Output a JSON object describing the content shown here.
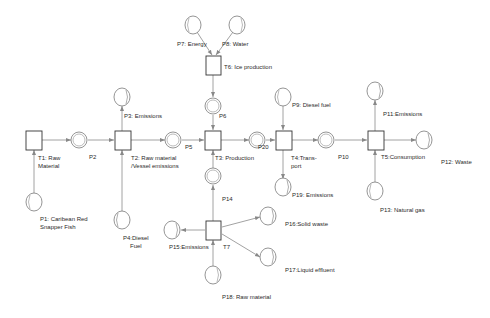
{
  "diagram": {
    "type": "petri-net",
    "style": {
      "line_color": "#8a8a8a",
      "box_color": "#333333",
      "place_color": "#777777",
      "background": "#ffffff"
    },
    "transitions": [
      {
        "id": "T1",
        "label": "T1: Raw\nMaterial"
      },
      {
        "id": "T2",
        "label": "T2: Raw material\n/Vessel emissions"
      },
      {
        "id": "T3",
        "label": "T3: Production"
      },
      {
        "id": "T4",
        "label": "T4:Trans-\nport"
      },
      {
        "id": "T5",
        "label": "T5:Consumption"
      },
      {
        "id": "T6",
        "label": "T6: Ice production"
      },
      {
        "id": "T7",
        "label": "T7"
      }
    ],
    "places": [
      {
        "id": "P1",
        "label": "P1: Caribean Red\nSnapper Fish"
      },
      {
        "id": "P2",
        "label": "P2"
      },
      {
        "id": "P3",
        "label": "P3: Emissions"
      },
      {
        "id": "P4",
        "label": "P4:Diesel\nFuel"
      },
      {
        "id": "P5",
        "label": "P5"
      },
      {
        "id": "P6",
        "label": "P6"
      },
      {
        "id": "P7",
        "label": "P7: Energy"
      },
      {
        "id": "P8",
        "label": "P8: Water"
      },
      {
        "id": "P9",
        "label": "P9: Diesel fuel"
      },
      {
        "id": "P10",
        "label": "P10"
      },
      {
        "id": "P11",
        "label": "P11:Emissions"
      },
      {
        "id": "P12",
        "label": "P12: Waste"
      },
      {
        "id": "P13",
        "label": "P13: Natural gas"
      },
      {
        "id": "P14",
        "label": "P14"
      },
      {
        "id": "P15",
        "label": "P15:Emissions"
      },
      {
        "id": "P16",
        "label": "P16:Solid waste"
      },
      {
        "id": "P17",
        "label": "P17:Liquid effluent"
      },
      {
        "id": "P18",
        "label": "P18: Raw material"
      },
      {
        "id": "P19",
        "label": "P19: Emissions"
      },
      {
        "id": "P20",
        "label": "P20"
      }
    ],
    "arcs": [
      [
        "P1",
        "T1"
      ],
      [
        "T1",
        "P2"
      ],
      [
        "P2",
        "T2"
      ],
      [
        "P4",
        "T2"
      ],
      [
        "T2",
        "P3"
      ],
      [
        "T2",
        "P5"
      ],
      [
        "P7",
        "T6"
      ],
      [
        "P8",
        "T6"
      ],
      [
        "T6",
        "P6"
      ],
      [
        "P6",
        "T3"
      ],
      [
        "P5",
        "T3"
      ],
      [
        "P14",
        "T3"
      ],
      [
        "T3",
        "P20"
      ],
      [
        "P20",
        "T4"
      ],
      [
        "P9",
        "T4"
      ],
      [
        "T4",
        "P19"
      ],
      [
        "T4",
        "P10"
      ],
      [
        "P10",
        "T5"
      ],
      [
        "P13",
        "T5"
      ],
      [
        "T5",
        "P11"
      ],
      [
        "T5",
        "P12"
      ],
      [
        "P18",
        "T7"
      ],
      [
        "T7",
        "P14"
      ],
      [
        "T7",
        "P15"
      ],
      [
        "T7",
        "P16"
      ],
      [
        "T7",
        "P17"
      ]
    ]
  }
}
